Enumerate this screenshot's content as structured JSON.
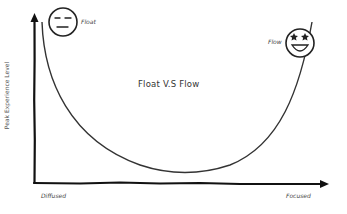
{
  "diagram": {
    "title": "Float V.S Flow",
    "y_axis_label": "Peak Experience Level",
    "x_axis": {
      "left_label": "Diffused",
      "right_label": "Focused"
    },
    "nodes": [
      {
        "id": "float",
        "label": "Float",
        "icon": "neutral-face-icon",
        "position": "top-left"
      },
      {
        "id": "flow",
        "label": "Flow",
        "icon": "star-struck-face-icon",
        "position": "top-right"
      }
    ],
    "curve": {
      "shape": "U-shaped",
      "description": "Peak experience high at both Diffused and Focused extremes, lowest in the middle"
    },
    "colors": {
      "stroke": "#222222",
      "background": "#ffffff",
      "text": "#444444"
    }
  }
}
